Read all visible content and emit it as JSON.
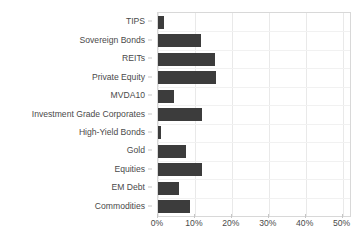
{
  "chart_data": {
    "type": "bar",
    "orientation": "horizontal",
    "title": "",
    "subtitle": "",
    "xlabel": "",
    "ylabel": "",
    "categories": [
      "TIPS",
      "Sovereign Bonds",
      "REITs",
      "Private Equity",
      "MVDA10",
      "Investment Grade Corporates",
      "High-Yield Bonds",
      "Gold",
      "Equities",
      "EM Debt",
      "Commodities"
    ],
    "values": [
      1.6,
      11.6,
      15.5,
      15.6,
      4.2,
      11.9,
      0.8,
      7.6,
      11.8,
      5.7,
      8.8
    ],
    "value_unit": "%",
    "xlim": [
      0,
      52
    ],
    "ylim": [
      0,
      11
    ],
    "xticks": [
      0,
      10,
      20,
      30,
      40,
      50
    ],
    "xticklabels": [
      "0%",
      "10%",
      "20%",
      "30%",
      "40%",
      "50%"
    ],
    "grid": true,
    "grid_axis": "both",
    "legend": null,
    "legend_position": "none",
    "bar_color": "#3c3c3c",
    "grid_color": "#e9e9e9",
    "axis_color": "#d8d8d8",
    "tick_label_color": "#4a4a4a",
    "background_color": "#ffffff",
    "annotations": []
  }
}
